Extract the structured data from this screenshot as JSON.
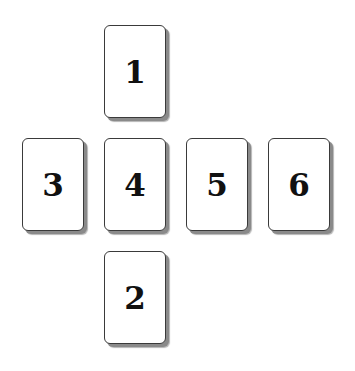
{
  "diagram": {
    "type": "card-spread-layout",
    "cards": [
      {
        "label": "1",
        "position": "top",
        "left": 104,
        "top": 25
      },
      {
        "label": "2",
        "position": "bottom",
        "left": 104,
        "top": 251
      },
      {
        "label": "3",
        "position": "middle-left",
        "left": 22,
        "top": 138
      },
      {
        "label": "4",
        "position": "center",
        "left": 104,
        "top": 138
      },
      {
        "label": "5",
        "position": "middle-right-1",
        "left": 186,
        "top": 138
      },
      {
        "label": "6",
        "position": "middle-right-2",
        "left": 268,
        "top": 138
      }
    ],
    "colors": {
      "background": "#ffffff",
      "card_fill": "#ffffff",
      "card_border": "#3a3a3a",
      "shadow": "#8a8a8a",
      "text": "#111111"
    }
  }
}
